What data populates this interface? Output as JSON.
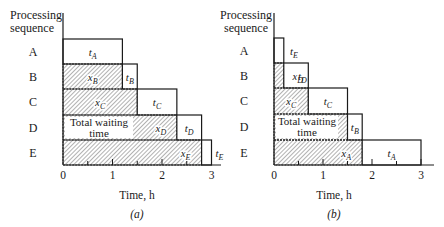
{
  "panels": [
    {
      "id": "a",
      "caption": "(a)",
      "ylabel_line1": "Processing",
      "ylabel_line2": "sequence",
      "xlabel": "Time, h",
      "xticks": [
        "0",
        "1",
        "2",
        "3"
      ],
      "rows": [
        {
          "label": "A",
          "wait": 0.0,
          "proc": 1.2,
          "wait_label": "",
          "proc_label": "t",
          "proc_sub": "A"
        },
        {
          "label": "B",
          "wait": 1.2,
          "proc": 0.3,
          "wait_label": "x",
          "wait_sub": "B",
          "proc_label": "t",
          "proc_sub": "B"
        },
        {
          "label": "C",
          "wait": 1.5,
          "proc": 0.8,
          "wait_label": "x",
          "wait_sub": "C",
          "proc_label": "t",
          "proc_sub": "C"
        },
        {
          "label": "D",
          "wait": 2.3,
          "proc": 0.5,
          "wait_label": "x",
          "wait_sub": "D",
          "proc_label": "t",
          "proc_sub": "D"
        },
        {
          "label": "E",
          "wait": 2.8,
          "proc": 0.2,
          "wait_label": "x",
          "wait_sub": "E",
          "proc_label": "t",
          "proc_sub": "E"
        }
      ],
      "annotation_line1": "Total waiting",
      "annotation_line2": "time"
    },
    {
      "id": "b",
      "caption": "(b)",
      "ylabel_line1": "Processing",
      "ylabel_line2": "sequence",
      "xlabel": "Time, h",
      "xticks": [
        "0",
        "1",
        "2",
        "3"
      ],
      "rows": [
        {
          "label": "A",
          "wait": 0.0,
          "proc": 0.2,
          "wait_label": "",
          "proc_label": "t",
          "proc_sub": "E"
        },
        {
          "label": "B",
          "wait": 0.2,
          "proc": 0.5,
          "wait_label": "x",
          "wait_sub": "D",
          "proc_label": "t",
          "proc_sub": "D"
        },
        {
          "label": "C",
          "wait": 0.7,
          "proc": 0.8,
          "wait_label": "x",
          "wait_sub": "C",
          "proc_label": "t",
          "proc_sub": "C"
        },
        {
          "label": "D",
          "wait": 1.5,
          "proc": 0.3,
          "wait_label": "x",
          "wait_sub": "B",
          "proc_label": "t",
          "proc_sub": "B"
        },
        {
          "label": "E",
          "wait": 1.8,
          "proc": 1.2,
          "wait_label": "x",
          "wait_sub": "A",
          "proc_label": "t",
          "proc_sub": "A"
        }
      ],
      "annotation_line1": "Total waiting",
      "annotation_line2": "time"
    }
  ],
  "colors": {
    "ink": "#1a1a1a",
    "hatch": "#555555",
    "background": "#ffffff"
  }
}
